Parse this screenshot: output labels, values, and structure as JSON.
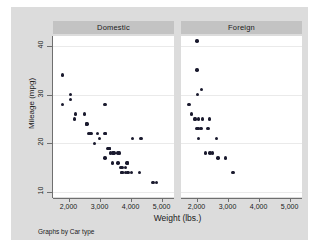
{
  "chart_data": {
    "type": "scatter",
    "title": "",
    "xlabel": "Weight (lbs.)",
    "ylabel": "Mileage (mpg)",
    "note": "Graphs by Car type",
    "xlim": [
      1500,
      5400
    ],
    "ylim": [
      9,
      42
    ],
    "xticks": [
      2000,
      3000,
      4000,
      5000
    ],
    "xtick_labels": [
      "2,000",
      "3,000",
      "4,000",
      "5,000"
    ],
    "yticks": [
      10,
      20,
      30,
      40
    ],
    "ytick_labels": [
      "10",
      "20",
      "30",
      "40"
    ],
    "grid": "horizontal",
    "legend": "none",
    "facet_by": "Car type",
    "panels": [
      {
        "label": "Domestic",
        "points": [
          {
            "x": 1800,
            "y": 34
          },
          {
            "x": 1800,
            "y": 28
          },
          {
            "x": 2070,
            "y": 30
          },
          {
            "x": 2070,
            "y": 29
          },
          {
            "x": 2200,
            "y": 25
          },
          {
            "x": 2230,
            "y": 26
          },
          {
            "x": 2520,
            "y": 26
          },
          {
            "x": 2580,
            "y": 24
          },
          {
            "x": 2600,
            "y": 24
          },
          {
            "x": 2640,
            "y": 22
          },
          {
            "x": 2670,
            "y": 22
          },
          {
            "x": 2730,
            "y": 22
          },
          {
            "x": 2830,
            "y": 20
          },
          {
            "x": 2930,
            "y": 22
          },
          {
            "x": 3000,
            "y": 21
          },
          {
            "x": 3180,
            "y": 28
          },
          {
            "x": 3170,
            "y": 22
          },
          {
            "x": 3200,
            "y": 22
          },
          {
            "x": 3250,
            "y": 19
          },
          {
            "x": 3280,
            "y": 19
          },
          {
            "x": 3300,
            "y": 19
          },
          {
            "x": 3310,
            "y": 19
          },
          {
            "x": 3330,
            "y": 19
          },
          {
            "x": 3350,
            "y": 18
          },
          {
            "x": 3170,
            "y": 17
          },
          {
            "x": 3430,
            "y": 18
          },
          {
            "x": 3470,
            "y": 18
          },
          {
            "x": 3600,
            "y": 18
          },
          {
            "x": 3640,
            "y": 18
          },
          {
            "x": 3420,
            "y": 16
          },
          {
            "x": 3600,
            "y": 16
          },
          {
            "x": 3690,
            "y": 15
          },
          {
            "x": 3740,
            "y": 15
          },
          {
            "x": 3880,
            "y": 16
          },
          {
            "x": 3900,
            "y": 16
          },
          {
            "x": 3830,
            "y": 15
          },
          {
            "x": 3700,
            "y": 14
          },
          {
            "x": 3720,
            "y": 14
          },
          {
            "x": 3740,
            "y": 14
          },
          {
            "x": 3830,
            "y": 14
          },
          {
            "x": 3900,
            "y": 14
          },
          {
            "x": 3920,
            "y": 14
          },
          {
            "x": 4030,
            "y": 14
          },
          {
            "x": 4060,
            "y": 21
          },
          {
            "x": 4330,
            "y": 21
          },
          {
            "x": 4290,
            "y": 14
          },
          {
            "x": 4720,
            "y": 12
          },
          {
            "x": 4840,
            "y": 12
          }
        ]
      },
      {
        "label": "Foreign",
        "points": [
          {
            "x": 2020,
            "y": 41
          },
          {
            "x": 2010,
            "y": 35
          },
          {
            "x": 2040,
            "y": 30
          },
          {
            "x": 2160,
            "y": 31
          },
          {
            "x": 1760,
            "y": 28
          },
          {
            "x": 1830,
            "y": 26
          },
          {
            "x": 1930,
            "y": 25
          },
          {
            "x": 1960,
            "y": 25
          },
          {
            "x": 2070,
            "y": 25
          },
          {
            "x": 2200,
            "y": 25
          },
          {
            "x": 2410,
            "y": 25
          },
          {
            "x": 1990,
            "y": 23
          },
          {
            "x": 2030,
            "y": 23
          },
          {
            "x": 2060,
            "y": 23
          },
          {
            "x": 2150,
            "y": 23
          },
          {
            "x": 2370,
            "y": 23
          },
          {
            "x": 2070,
            "y": 21
          },
          {
            "x": 2650,
            "y": 21
          },
          {
            "x": 2280,
            "y": 18
          },
          {
            "x": 2440,
            "y": 18
          },
          {
            "x": 2520,
            "y": 18
          },
          {
            "x": 2690,
            "y": 17
          },
          {
            "x": 2930,
            "y": 17
          },
          {
            "x": 3170,
            "y": 14
          }
        ]
      }
    ]
  },
  "colors": {
    "canvas": "#dcdcdc",
    "plot_background": "#ffffff",
    "panel_header": "#c3c3c3",
    "marker": "#1a1a2e",
    "gridline": "#eaeaea",
    "axis": "#6f6f6f"
  }
}
